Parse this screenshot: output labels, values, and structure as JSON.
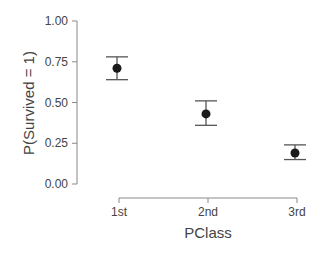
{
  "chart_data": {
    "type": "scatter",
    "subtype": "point-with-error-bars",
    "title": "",
    "xlabel": "PClass",
    "ylabel": "P(Survived = 1)",
    "categories": [
      "1st",
      "2nd",
      "3rd"
    ],
    "values": [
      0.71,
      0.43,
      0.19
    ],
    "error_lower": [
      0.64,
      0.36,
      0.15
    ],
    "error_upper": [
      0.78,
      0.51,
      0.24
    ],
    "ylim": [
      0,
      1
    ],
    "yticks": [
      0.0,
      0.25,
      0.5,
      0.75,
      1.0
    ],
    "ytick_labels": [
      "0.00",
      "0.25",
      "0.50",
      "0.75",
      "1.00"
    ],
    "grid": false,
    "legend": null
  },
  "colors": {
    "axis": "#888888",
    "point": "#1a1a1a",
    "errorbar": "#555555",
    "text": "#444444"
  }
}
